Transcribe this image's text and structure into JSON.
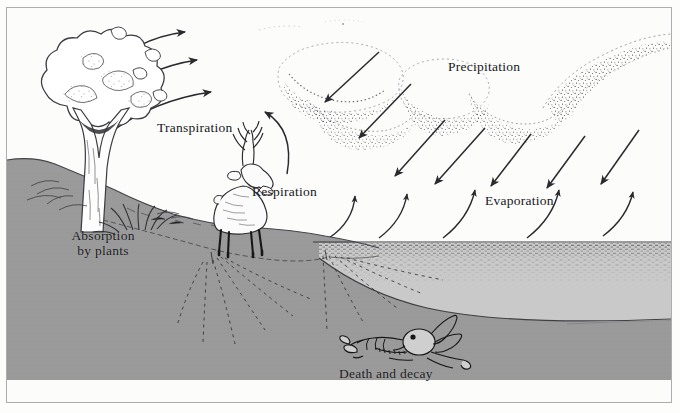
{
  "figure": {
    "type": "illustration-diagram",
    "border_color": "#4a4a4a",
    "ink_color": "#17171a",
    "ground_color": "#9a9a9a",
    "water_color": "#c9c9c9",
    "paper_color": "#fcfcfb"
  },
  "labels": {
    "transpiration": "Transpiration",
    "precipitation": "Precipitation",
    "respiration": "Respiration",
    "evaporation": "Evaporation",
    "absorption_line1": "Absorption",
    "absorption_line2": "by plants",
    "death_and_decay": "Death and decay"
  },
  "scene_elements": {
    "tree": "broadleaf-tree",
    "shrub": "grass-tuft",
    "animal": "deer",
    "skeleton": "animal-skeleton",
    "clouds": "stippled-cloud-band",
    "water_body": "lake",
    "soil": "soil-cross-section",
    "roots": "root-network"
  },
  "arrows": {
    "transpiration_count": 3,
    "transpiration_direction": "up-right",
    "respiration_count": 1,
    "respiration_direction": "up-right-curving",
    "precipitation_count": 7,
    "precipitation_direction": "down-left",
    "evaporation_count": 5,
    "evaporation_direction": "up-right-curving"
  }
}
